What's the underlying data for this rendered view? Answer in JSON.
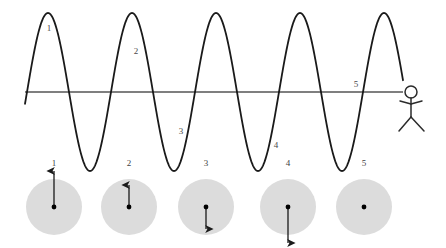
{
  "figure": {
    "background_color": "#ffffff",
    "width": 446,
    "height": 248
  },
  "chart_data": {
    "type": "line",
    "title": "",
    "xlabel": "",
    "ylabel": "",
    "grid": false,
    "legend": null,
    "xlim": [
      25,
      403
    ],
    "ylim": [
      13,
      171
    ],
    "axis_line": {
      "name": "equilibrium-axis",
      "y": 92,
      "x_start": 25,
      "x_end": 403,
      "color": "#555555"
    },
    "wave": {
      "name": "sine-wave",
      "color": "#1a1a1a",
      "stroke_width": 1.8,
      "amplitude": 79,
      "period": 84,
      "zero_crossings": [
        70,
        112,
        154,
        196,
        238,
        280,
        322,
        364
      ],
      "peaks_x": [
        48,
        132,
        216,
        300,
        384
      ],
      "troughs_x": [
        91,
        175,
        259,
        343
      ],
      "x_start": 25,
      "x_end": 403
    },
    "wave_point_labels": [
      {
        "id": "1",
        "x": 49,
        "y": 28,
        "at_x": 48,
        "at_y": 14,
        "phase": "crest"
      },
      {
        "id": "2",
        "x": 136,
        "y": 51,
        "at_x": 143,
        "at_y": 48,
        "phase": "rising-through-crest"
      },
      {
        "id": "3",
        "x": 181,
        "y": 131,
        "at_x": 175,
        "at_y": 165,
        "phase": "trough-approach"
      },
      {
        "id": "4",
        "x": 276,
        "y": 145,
        "at_x": 259,
        "at_y": 170,
        "phase": "trough"
      },
      {
        "id": "5",
        "x": 356,
        "y": 84,
        "at_x": 364,
        "at_y": 92,
        "phase": "zero-crossing"
      }
    ]
  },
  "particles": {
    "label_y": 166,
    "circle_center_y": 207,
    "circle_radius": 28,
    "circle_fill": "#dcdcdc",
    "dot_color": "#000000",
    "arrow_color": "#1a1a1a",
    "items": [
      {
        "id": "1",
        "label": "1",
        "cx": 54,
        "arrow_direction": "up",
        "arrow_length": 36,
        "arrow_tip_y": 171,
        "velocity": "maximum upward",
        "has_arrow": true
      },
      {
        "id": "2",
        "label": "2",
        "cx": 129,
        "arrow_direction": "up",
        "arrow_length": 22,
        "arrow_tip_y": 185,
        "velocity": "moderate upward",
        "has_arrow": true
      },
      {
        "id": "3",
        "label": "3",
        "cx": 206,
        "arrow_direction": "down",
        "arrow_length": 22,
        "arrow_tip_y": 229,
        "velocity": "moderate downward",
        "has_arrow": true
      },
      {
        "id": "4",
        "label": "4",
        "cx": 288,
        "arrow_direction": "down",
        "arrow_length": 36,
        "arrow_tip_y": 243,
        "velocity": "maximum downward",
        "has_arrow": true
      },
      {
        "id": "5",
        "label": "5",
        "cx": 364,
        "arrow_direction": "none",
        "arrow_length": 0,
        "arrow_tip_y": 207,
        "velocity": "zero",
        "has_arrow": false
      }
    ]
  },
  "observer": {
    "name": "stick-figure-observer",
    "color": "#2b2b2b",
    "head_cx": 411,
    "head_cy": 92,
    "head_r": 6,
    "body_top_y": 98,
    "body_bottom_y": 117,
    "arm_y": 104,
    "arm_left_x": 400,
    "arm_right_x": 422,
    "leg_left_x": 399,
    "leg_right_x": 424,
    "leg_bottom_y": 131
  }
}
